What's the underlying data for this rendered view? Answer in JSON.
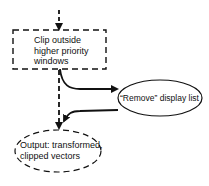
{
  "diagram": {
    "nodes": [
      {
        "id": "clip",
        "shape": "dashed-rectangle",
        "lines": [
          "Clip outside",
          "higher priority",
          "windows"
        ]
      },
      {
        "id": "remove",
        "shape": "solid-ellipse",
        "label": "“Remove” display list"
      },
      {
        "id": "output",
        "shape": "dashed-ellipse",
        "lines": [
          "Output: transformed,",
          "clipped vectors"
        ]
      }
    ],
    "edges": [
      {
        "from": "input",
        "to": "clip",
        "style": "dashed"
      },
      {
        "from": "clip",
        "to": "remove",
        "style": "solid"
      },
      {
        "from": "remove",
        "to": "output",
        "style": "solid"
      },
      {
        "from": "clip",
        "to": "output",
        "style": "dashed"
      }
    ]
  }
}
